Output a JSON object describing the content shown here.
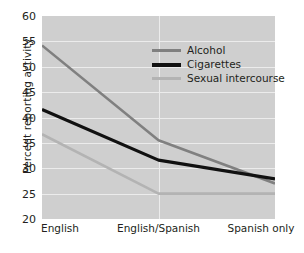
{
  "chart_data": {
    "type": "line",
    "title": "",
    "xlabel": "",
    "ylabel": "Percent reporting activity",
    "categories": [
      "English",
      "English/Spanish",
      "Spanish only"
    ],
    "ylim": [
      20,
      60
    ],
    "yticks": [
      20,
      25,
      30,
      35,
      40,
      45,
      50,
      55,
      60
    ],
    "ytick_labels": [
      "20",
      "25",
      "30",
      "35",
      "40",
      "45",
      "50",
      "55",
      "60"
    ],
    "grid": "horizontal-and-vertical",
    "legend_position": "upper-center",
    "series": [
      {
        "name": "Alcohol",
        "color": "#808080",
        "values": [
          54.2,
          35.5,
          27.0
        ]
      },
      {
        "name": "Cigarettes",
        "color": "#111111",
        "values": [
          41.6,
          31.6,
          27.9
        ]
      },
      {
        "name": "Sexual intercourse",
        "color": "#b3b3b3",
        "values": [
          36.7,
          25.0,
          25.0
        ]
      }
    ]
  },
  "axes": {
    "y_title": "Percent reporting activity",
    "y_tick_labels": [
      "60",
      "55",
      "50",
      "45",
      "40",
      "35",
      "30",
      "25",
      "20"
    ],
    "x_tick_labels": [
      "English",
      "English/Spanish",
      "Spanish only"
    ]
  },
  "legend": {
    "items": [
      {
        "label": "Alcohol",
        "color": "#808080"
      },
      {
        "label": "Cigarettes",
        "color": "#111111"
      },
      {
        "label": "Sexual intercourse",
        "color": "#b3b3b3"
      }
    ]
  },
  "colors": {
    "plot_background": "#cfcfcf",
    "gridline": "#ececec",
    "page_background": "#ffffff",
    "text": "#231f20"
  }
}
